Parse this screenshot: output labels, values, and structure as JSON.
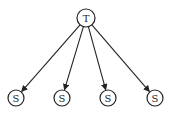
{
  "diagram": {
    "type": "tree",
    "root": {
      "id": "T",
      "label": "T",
      "x": 86,
      "y": 18,
      "r": 9
    },
    "children": [
      {
        "id": "S1",
        "label": "S",
        "x": 16,
        "y": 98,
        "r": 8
      },
      {
        "id": "S2",
        "label": "S",
        "x": 62,
        "y": 98,
        "r": 8
      },
      {
        "id": "S3",
        "label": "S",
        "x": 108,
        "y": 98,
        "r": 8
      },
      {
        "id": "S4",
        "label": "S",
        "x": 155,
        "y": 98,
        "r": 8
      }
    ],
    "edges": [
      {
        "from": "T",
        "to": "S1"
      },
      {
        "from": "T",
        "to": "S2"
      },
      {
        "from": "T",
        "to": "S3"
      },
      {
        "from": "T",
        "to": "S4"
      }
    ]
  }
}
